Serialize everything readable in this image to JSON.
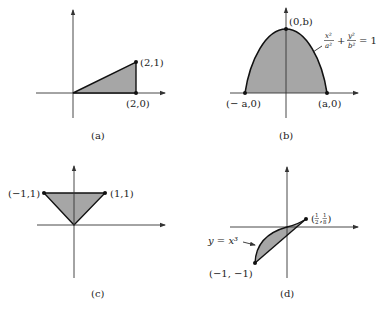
{
  "figure": {
    "panels": [
      {
        "id": "a",
        "caption": "(a)",
        "points": [
          {
            "label": "(2,1)",
            "x": 2,
            "y": 1
          },
          {
            "label": "(2,0)",
            "x": 2,
            "y": 0
          }
        ],
        "region": "triangle with vertices (0,0), (2,0), (2,1)"
      },
      {
        "id": "b",
        "caption": "(b)",
        "points": [
          {
            "label": "(0,b)"
          },
          {
            "label": "(− a,0)"
          },
          {
            "label": "(a,0)"
          }
        ],
        "curve_label": {
          "lhs1_num": "x²",
          "lhs1_den": "a²",
          "plus": "+",
          "lhs2_num": "y²",
          "lhs2_den": "b²",
          "rhs": "= 1"
        },
        "region": "upper half of ellipse x²/a² + y²/b² = 1"
      },
      {
        "id": "c",
        "caption": "(c)",
        "points": [
          {
            "label": "(−1,1)",
            "x": -1,
            "y": 1
          },
          {
            "label": "(1,1)",
            "x": 1,
            "y": 1
          }
        ],
        "region": "triangle with vertices (0,0), (-1,1), (1,1)"
      },
      {
        "id": "d",
        "caption": "(d)",
        "points": [
          {
            "label_num1": "1",
            "label_den1": "2",
            "label_num2": "1",
            "label_den2": "8"
          },
          {
            "label": "(−1, −1)",
            "x": -1,
            "y": -1
          }
        ],
        "curve_label": "y = x³",
        "region": "region between y = x³ and a line from (-1,-1) to (1/2,1/8)"
      }
    ],
    "colors": {
      "fill": "#a6a6a6",
      "stroke": "#111111",
      "axis": "#333333"
    }
  }
}
